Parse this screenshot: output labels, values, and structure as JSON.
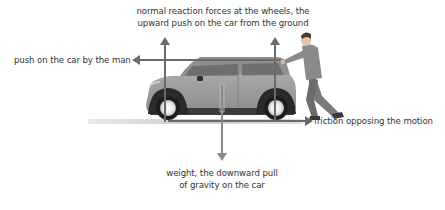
{
  "diagram": {
    "labels": {
      "normal_line1": "normal reaction forces at the wheels, the",
      "normal_line2": "upward push on the car from the ground",
      "push": "push on the car by the man",
      "friction": "friction opposing the motion",
      "weight_line1": "weight, the downward pull",
      "weight_line2": "of gravity on the car"
    },
    "arrows": [
      {
        "name": "normal-reaction-front",
        "direction": "up"
      },
      {
        "name": "normal-reaction-rear",
        "direction": "up"
      },
      {
        "name": "push-by-man",
        "direction": "left"
      },
      {
        "name": "friction",
        "direction": "right"
      },
      {
        "name": "weight",
        "direction": "down"
      }
    ],
    "colors": {
      "arrow": "#6a6a6a",
      "car_body": "#9a9a9a",
      "ground": "#d4d4d4",
      "text": "#333333"
    }
  }
}
